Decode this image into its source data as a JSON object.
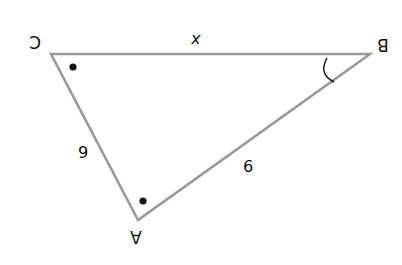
{
  "figure": {
    "type": "triangle",
    "orientation": "rotated 180 degrees",
    "colors": {
      "edge": "#9a9a9a",
      "text": "#111111",
      "marks": "#111111",
      "background": "#ffffff"
    },
    "vertices": [
      {
        "name": "A",
        "label": "A",
        "x": 138,
        "y": 220
      },
      {
        "name": "B",
        "label": "B",
        "x": 370,
        "y": 54
      },
      {
        "name": "C",
        "label": "C",
        "x": 51,
        "y": 54
      }
    ],
    "sides": [
      {
        "between": "C-B",
        "label": "x"
      },
      {
        "between": "C-A",
        "label": "6"
      },
      {
        "between": "A-B",
        "label": "9"
      }
    ],
    "angle_marks": [
      {
        "at": "C",
        "mark": "dot"
      },
      {
        "at": "A",
        "mark": "dot"
      },
      {
        "at": "B",
        "mark": "arc"
      }
    ]
  }
}
